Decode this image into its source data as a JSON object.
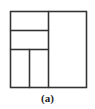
{
  "figure": {
    "caption": "(a)",
    "stroke_color": "#333333",
    "background": "#ffffff",
    "outer_square": {
      "x": 10,
      "y": 11,
      "width": 76,
      "height": 76
    },
    "partitions": [
      {
        "name": "right-half",
        "x": 48,
        "y": 11,
        "width": 38,
        "height": 76
      },
      {
        "name": "top-left-strip",
        "x": 10,
        "y": 11,
        "width": 38,
        "height": 19
      },
      {
        "name": "middle-left-strip",
        "x": 10,
        "y": 30,
        "width": 38,
        "height": 19
      },
      {
        "name": "bottom-left-cell-1",
        "x": 10,
        "y": 49,
        "width": 19,
        "height": 38
      },
      {
        "name": "bottom-left-cell-2",
        "x": 29,
        "y": 49,
        "width": 19,
        "height": 38
      }
    ]
  }
}
